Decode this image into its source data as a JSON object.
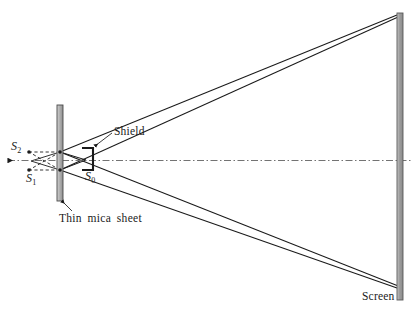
{
  "figure": {
    "background_color": "#ffffff",
    "ink_color": "#1a1a1a",
    "width": 419,
    "height": 312
  },
  "labels": {
    "source_s2": "S",
    "source_s2_sub": "2",
    "source_s1": "S",
    "source_s1_sub": "1",
    "source_s0": "S",
    "source_s0_sub": "0",
    "shield": "Shield",
    "mica_sheet": "Thin mica sheet",
    "screen": "Screen"
  },
  "elements": {
    "mica_sheet": {
      "name": "Thin mica sheet",
      "x": 57,
      "y": 105,
      "width": 6,
      "height": 96,
      "fill": "#b4b4b4",
      "stroke": "#4a4a4a"
    },
    "screen": {
      "name": "Screen",
      "x": 397,
      "y": 13,
      "width": 6,
      "height": 287,
      "fill": "#a8a8a8",
      "stroke": "#5a5a5a"
    },
    "shield": {
      "name": "Shield bracket",
      "x": 82,
      "y": 148,
      "width": 11,
      "height": 22,
      "stroke": "#1a1a1a"
    },
    "optical_axis": {
      "name": "Optical axis",
      "y": 160,
      "x_start": 8,
      "x_end": 412,
      "style": "dash-dot"
    },
    "slits": [
      {
        "name": "upper slit",
        "x": 60,
        "y": 152
      },
      {
        "name": "lower slit",
        "x": 60,
        "y": 170
      }
    ],
    "virtual_sources": [
      {
        "name": "S2",
        "x": 29,
        "y": 152
      },
      {
        "name": "S1",
        "x": 29,
        "y": 170
      }
    ],
    "ray_targets": {
      "screen_top": {
        "x": 397,
        "y": 15
      },
      "screen_bottom": {
        "x": 397,
        "y": 288
      }
    }
  },
  "colors": {
    "ink": "#1a1a1a",
    "mica_fill": "#b4b4b4",
    "screen_fill": "#a8a8a8",
    "axis": "#6b6b6b",
    "dashed_construction": "#3a3a3a"
  }
}
